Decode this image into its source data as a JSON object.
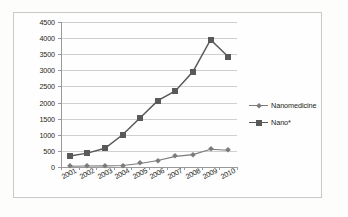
{
  "chart_data": {
    "type": "line",
    "title": "",
    "xlabel": "",
    "ylabel": "",
    "categories": [
      "2001",
      "2002",
      "2003",
      "2004",
      "2005",
      "2006",
      "2007",
      "2008",
      "2009",
      "2010"
    ],
    "ylim": [
      0,
      4500
    ],
    "ytick_step": 500,
    "yticks": [
      "0",
      "500",
      "1000",
      "1500",
      "2000",
      "2500",
      "3000",
      "3500",
      "4000",
      "4500"
    ],
    "grid": true,
    "legend_position": "right",
    "series": [
      {
        "name": "Nanomedicine",
        "marker": "diamond",
        "color": "#7b7b7b",
        "values": [
          25,
          30,
          35,
          45,
          110,
          200,
          330,
          385,
          550,
          520
        ]
      },
      {
        "name": "Nano*",
        "marker": "square",
        "color": "#595959",
        "values": [
          340,
          430,
          580,
          1000,
          1530,
          2060,
          2360,
          2960,
          3950,
          3420
        ]
      }
    ]
  },
  "legend": {
    "items": [
      {
        "label": "Nanomedicine"
      },
      {
        "label": "Nano*"
      }
    ]
  }
}
